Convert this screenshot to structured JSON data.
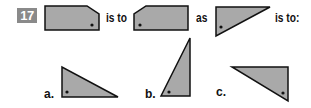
{
  "question": {
    "number": "17",
    "word_is_to_1": "is to",
    "word_as": "as",
    "word_is_to_2": "is to:"
  },
  "options": [
    {
      "label": "a.",
      "shape": "right-triangle",
      "right_angle": "bottom-left",
      "dot": "bottom-left"
    },
    {
      "label": "b.",
      "shape": "right-triangle",
      "right_angle": "bottom-right",
      "dot": "bottom-left"
    },
    {
      "label": "c.",
      "shape": "right-triangle",
      "right_angle": "top-right",
      "dot": "bottom-right"
    }
  ],
  "figures": [
    {
      "name": "pentagon-cut-top-right",
      "dot": "bottom-right"
    },
    {
      "name": "pentagon-cut-top-left",
      "dot": "bottom-left"
    },
    {
      "name": "right-triangle",
      "right_angle": "bottom-left",
      "dot": "bottom-left"
    }
  ],
  "colors": {
    "fill": "#a9a9a9",
    "stroke": "#111111",
    "badge": "#8a8a8a"
  }
}
